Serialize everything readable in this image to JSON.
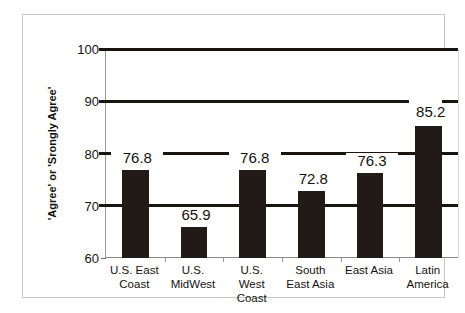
{
  "chart_data": {
    "type": "bar",
    "title": "",
    "subtitle": "",
    "xlabel": "",
    "ylabel": "'Agree' or 'Srongly Agree'",
    "categories": [
      "U.S. East Coast",
      "U.S. MidWest",
      "U.S. West Coast",
      "South East Asia",
      "East Asia",
      "Latin America"
    ],
    "category_lines": [
      [
        "U.S. East",
        "Coast"
      ],
      [
        "U.S.",
        "MidWest"
      ],
      [
        "U.S.",
        "West",
        "Coast"
      ],
      [
        "South",
        "East Asia"
      ],
      [
        "East Asia"
      ],
      [
        "Latin",
        "America"
      ]
    ],
    "values": [
      76.8,
      65.9,
      76.8,
      72.8,
      76.3,
      85.2
    ],
    "value_labels": [
      "76.8",
      "65.9",
      "76.8",
      "72.8",
      "76.3",
      "85.2"
    ],
    "ylim": [
      60,
      100
    ],
    "yticks": [
      60,
      70,
      80,
      90,
      100
    ],
    "ytick_labels": [
      "60",
      "70",
      "80",
      "90",
      "100"
    ],
    "gridlines": [
      70,
      80,
      90,
      100
    ],
    "grid": true,
    "legend": null,
    "legend_position": "none",
    "bar_color": "#221a16",
    "grid_color": "#1a1411",
    "background_color": "#ffffff",
    "frame_color": "#c9c9c9"
  }
}
